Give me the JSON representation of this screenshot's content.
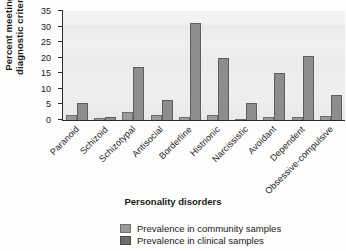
{
  "chart_data": {
    "type": "bar",
    "title": "",
    "xlabel": "Personality disorders",
    "ylabel": "Percent meeting diagnostic criteria",
    "ylim": [
      0,
      35
    ],
    "yticks": [
      0,
      5,
      10,
      15,
      20,
      25,
      30,
      35
    ],
    "grid": false,
    "legend_position": "bottom",
    "categories": [
      "Paranoid",
      "Schizoid",
      "Schizotypal",
      "Antisocial",
      "Borderline",
      "Histrionic",
      "Narcissistic",
      "Avoidant",
      "Dependent",
      "Obsessive-compulsive"
    ],
    "series": [
      {
        "name": "Prevalence in community samples",
        "color": "#9a9a9a",
        "values": [
          1.5,
          0.5,
          2.5,
          1.5,
          1.0,
          1.5,
          0.3,
          1.0,
          1.0,
          1.3
        ]
      },
      {
        "name": "Prevalence in clinical samples",
        "color": "#8d8d8d",
        "values": [
          5.5,
          1.0,
          17.0,
          6.5,
          31.0,
          20.0,
          5.5,
          15.0,
          20.5,
          8.0
        ]
      }
    ]
  },
  "axis": {
    "y_title_line1": "Percent meeting",
    "y_title_line2": "diagnostic criteria"
  }
}
